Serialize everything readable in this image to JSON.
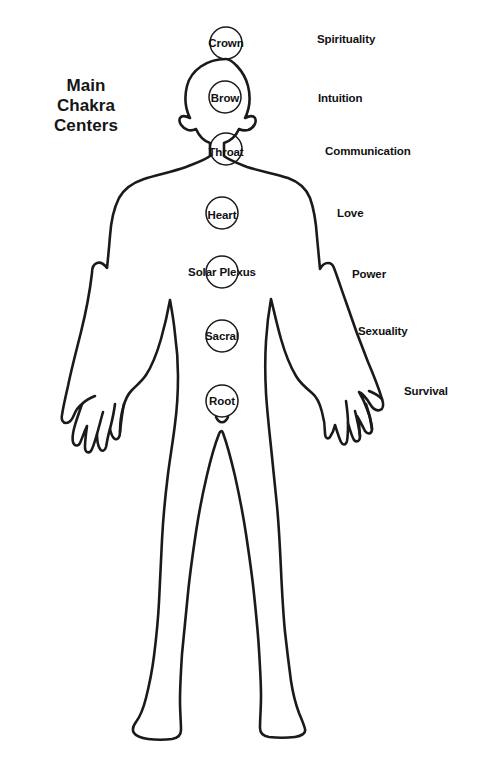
{
  "title": {
    "line1": "Main",
    "line2": "Chakra",
    "line3": "Centers"
  },
  "colors": {
    "ink": "#111111",
    "background": "#ffffff",
    "outline": "#1a1a1a"
  },
  "diagram": {
    "figure_name": "human-body-outline",
    "chakras": [
      {
        "id": "crown",
        "label": "Crown",
        "cx": 226,
        "cy": 43,
        "r": 16,
        "label_x": 226,
        "label_y": 43
      },
      {
        "id": "brow",
        "label": "Brow",
        "cx": 225,
        "cy": 97,
        "r": 16,
        "label_x": 225,
        "label_y": 98
      },
      {
        "id": "throat",
        "label": "Throat",
        "cx": 226,
        "cy": 149,
        "r": 16,
        "label_x": 226,
        "label_y": 152
      },
      {
        "id": "heart",
        "label": "Heart",
        "cx": 222,
        "cy": 213,
        "r": 16,
        "label_x": 222,
        "label_y": 215
      },
      {
        "id": "solar-plexus",
        "label": "Solar Plexus",
        "cx": 222,
        "cy": 272,
        "r": 16,
        "label_x": 222,
        "label_y": 272
      },
      {
        "id": "sacral",
        "label": "Sacral",
        "cx": 222,
        "cy": 336,
        "r": 16,
        "label_x": 222,
        "label_y": 336
      },
      {
        "id": "root",
        "label": "Root",
        "cx": 222,
        "cy": 401,
        "r": 16,
        "label_x": 222,
        "label_y": 401
      }
    ],
    "meanings": [
      {
        "id": "spirituality",
        "label": "Spirituality",
        "x": 317,
        "y": 33
      },
      {
        "id": "intuition",
        "label": "Intuition",
        "x": 318,
        "y": 92
      },
      {
        "id": "communication",
        "label": "Communication",
        "x": 325,
        "y": 145
      },
      {
        "id": "love",
        "label": "Love",
        "x": 337,
        "y": 207
      },
      {
        "id": "power",
        "label": "Power",
        "x": 352,
        "y": 268
      },
      {
        "id": "sexuality",
        "label": "Sexuality",
        "x": 358,
        "y": 325
      },
      {
        "id": "survival",
        "label": "Survival",
        "x": 404,
        "y": 385
      }
    ]
  }
}
